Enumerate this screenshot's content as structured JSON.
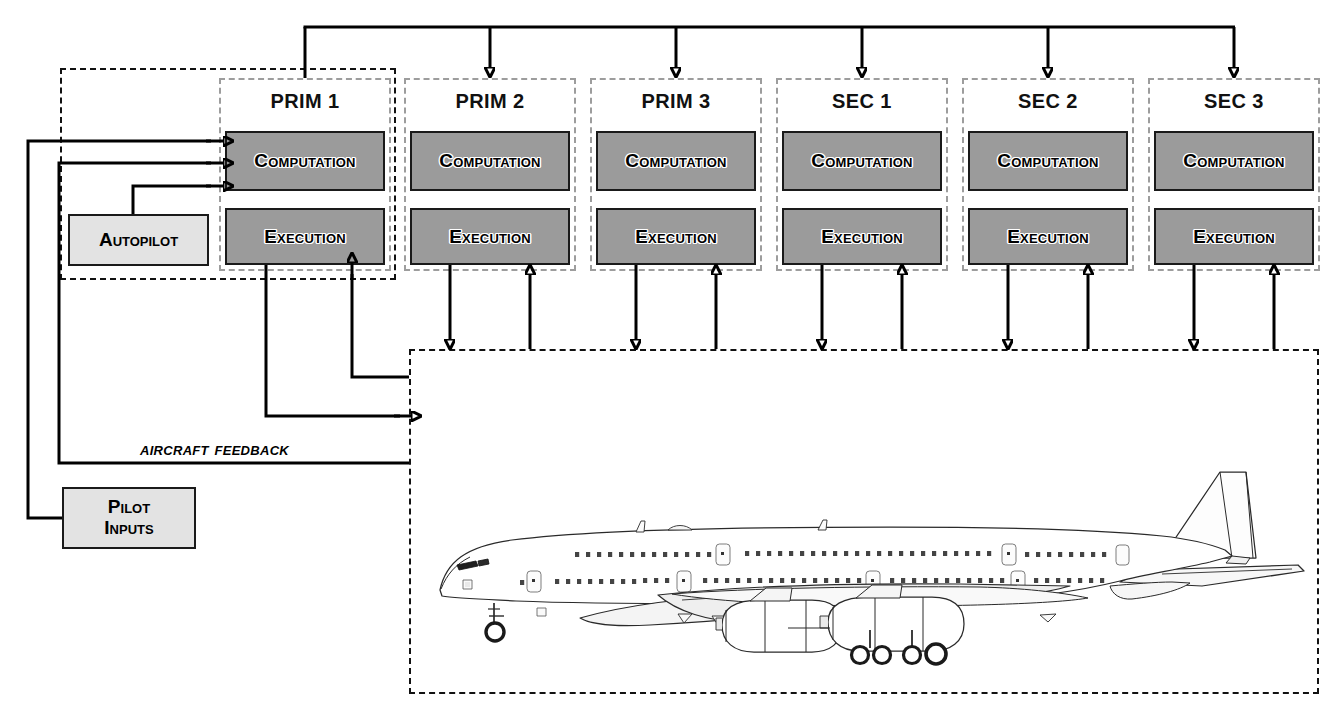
{
  "diagram": {
    "units": [
      {
        "name": "PRIM 1",
        "blocks": [
          "Computation",
          "Execution"
        ]
      },
      {
        "name": "PRIM 2",
        "blocks": [
          "Computation",
          "Execution"
        ]
      },
      {
        "name": "PRIM 3",
        "blocks": [
          "Computation",
          "Execution"
        ]
      },
      {
        "name": "SEC 1",
        "blocks": [
          "Computation",
          "Execution"
        ]
      },
      {
        "name": "SEC 2",
        "blocks": [
          "Computation",
          "Execution"
        ]
      },
      {
        "name": "SEC 3",
        "blocks": [
          "Computation",
          "Execution"
        ]
      }
    ],
    "autopilot": {
      "label": "Autopilot"
    },
    "pilot_inputs": {
      "label_line1": "Pilot",
      "label_line2": "Inputs"
    },
    "feedback_caption": "Aircraft Feedback",
    "aircraft": {
      "label": "Airbus A380 side view"
    },
    "colors": {
      "function_block_fill": "#9b9b9b",
      "light_block_fill": "#e3e3e3",
      "unit_border": "#9d9d9d",
      "group_border": "#111111",
      "wire": "#000000",
      "background": "#ffffff"
    }
  }
}
